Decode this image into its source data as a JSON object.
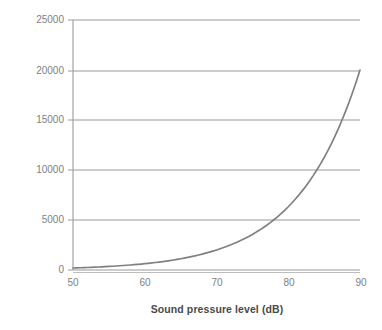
{
  "chart_data": {
    "type": "line",
    "title": "",
    "xlabel": "Sound pressure level (dB)",
    "ylabel": "Sound pressure (pascals)",
    "xlim": [
      50,
      90
    ],
    "ylim": [
      0,
      25000
    ],
    "xticks": [
      "50",
      "60",
      "70",
      "80",
      "90"
    ],
    "xtick_values": [
      50,
      60,
      70,
      80,
      90
    ],
    "yticks": [
      "0",
      "5000",
      "10000",
      "15000",
      "20000",
      "25000"
    ],
    "ytick_values": [
      0,
      5000,
      10000,
      15000,
      20000,
      25000
    ],
    "grid": "horizontal",
    "legend": "none",
    "series": [
      {
        "name": "Sound pressure",
        "x": [
          50,
          52,
          54,
          56,
          58,
          60,
          62,
          64,
          66,
          68,
          70,
          72,
          74,
          76,
          78,
          80,
          81,
          82,
          83,
          84,
          85,
          86,
          87,
          88,
          89,
          90
        ],
        "values": [
          6,
          8,
          10,
          13,
          16,
          20,
          25,
          32,
          40,
          50,
          63,
          80,
          100,
          126,
          159,
          200,
          224,
          252,
          282,
          316,
          356,
          399,
          448,
          502,
          563,
          632
        ]
      }
    ],
    "series_display": {
      "name": "Sound pressure",
      "note": "Exponential curve scaled so it reaches 20000 pascals at 90 dB",
      "x": [
        50,
        55,
        60,
        62.5,
        65,
        67.5,
        70,
        72.5,
        75,
        77.5,
        80,
        81,
        82,
        83,
        84,
        85,
        86,
        87,
        88,
        89,
        90
      ],
      "values": [
        0,
        0,
        0,
        0,
        0,
        0,
        20,
        45,
        110,
        230,
        500,
        680,
        920,
        1250,
        1700,
        2350,
        3300,
        4900,
        7500,
        12200,
        20000
      ]
    },
    "line_color": "#808080",
    "gridline_color": "#9a9a9a",
    "axis_color": "#808080",
    "tick_label_color": "#808080",
    "axis_label_color": "#4a4a4a",
    "background": "#ffffff"
  }
}
